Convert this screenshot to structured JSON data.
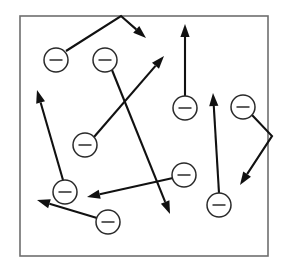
{
  "figure": {
    "domain_type": "diagram",
    "width": 290,
    "height": 272,
    "background_color": "#ffffff",
    "frame": {
      "name": "bounding-box",
      "x": 20,
      "y": 16,
      "width": 248,
      "height": 240,
      "stroke_color": "#6e6e6e",
      "fill_color": "#ffffff",
      "stroke_width": 1.6
    },
    "styles": {
      "vector_color": "#111111",
      "vector_width": 2.1,
      "charge_stroke_color": "#2a2a2a",
      "charge_fill_color": "#ffffff",
      "charge_radius": 12,
      "charge_sign_label": "minus",
      "charge_sign_half_width": 6.5,
      "arrow_head_length": 13,
      "arrow_head_half_width": 4.6
    },
    "charges": [
      {
        "id": "charge-1",
        "label": "minus",
        "cx": 56,
        "cy": 60,
        "r": 12
      },
      {
        "id": "charge-2",
        "label": "minus",
        "cx": 105,
        "cy": 60,
        "r": 12
      },
      {
        "id": "charge-3",
        "label": "minus",
        "cx": 185,
        "cy": 108,
        "r": 12
      },
      {
        "id": "charge-4",
        "label": "minus",
        "cx": 243,
        "cy": 107,
        "r": 12
      },
      {
        "id": "charge-5",
        "label": "minus",
        "cx": 85,
        "cy": 145,
        "r": 12
      },
      {
        "id": "charge-6",
        "label": "minus",
        "cx": 184,
        "cy": 175,
        "r": 12
      },
      {
        "id": "charge-7",
        "label": "minus",
        "cx": 219,
        "cy": 205,
        "r": 12
      },
      {
        "id": "charge-8",
        "label": "minus",
        "cx": 65,
        "cy": 192,
        "r": 12
      },
      {
        "id": "charge-9",
        "label": "minus",
        "cx": 108,
        "cy": 222,
        "r": 12
      }
    ],
    "vectors": [
      {
        "id": "vector-1",
        "description": "bent arrow from charge-1 up to apex then down-right",
        "points": [
          [
            66,
            51
          ],
          [
            121,
            16
          ],
          [
            146,
            38
          ]
        ],
        "arrowhead_at": "end"
      },
      {
        "id": "vector-2",
        "description": "arrow from charge-2 down-right to lower middle",
        "points": [
          [
            112,
            70
          ],
          [
            170,
            214
          ]
        ],
        "arrowhead_at": "end"
      },
      {
        "id": "vector-3",
        "description": "arrow from charge-5 up-right across the field",
        "points": [
          [
            94,
            137
          ],
          [
            164,
            56
          ]
        ],
        "arrowhead_at": "end"
      },
      {
        "id": "vector-4",
        "description": "vertical arrow upward from charge-3",
        "points": [
          [
            185,
            96
          ],
          [
            185,
            24
          ]
        ],
        "arrowhead_at": "end"
      },
      {
        "id": "vector-5",
        "description": "bent arrow from charge-4 right-down then down-left",
        "points": [
          [
            252,
            115
          ],
          [
            272,
            136
          ],
          [
            240,
            185
          ]
        ],
        "arrowhead_at": "end"
      },
      {
        "id": "vector-6",
        "description": "long arrow upward from charge-7",
        "points": [
          [
            219,
            193
          ],
          [
            213,
            93
          ]
        ],
        "arrowhead_at": "end"
      },
      {
        "id": "vector-7",
        "description": "arrow from charge-6 left-down to middle-left",
        "points": [
          [
            173,
            178
          ],
          [
            87,
            197
          ]
        ],
        "arrowhead_at": "end"
      },
      {
        "id": "vector-8",
        "description": "arrow from charge-8 up-left toward upper-left corner",
        "points": [
          [
            63,
            180
          ],
          [
            37,
            90
          ]
        ],
        "arrowhead_at": "end"
      },
      {
        "id": "vector-9",
        "description": "arrow from charge-9 up-left to the left edge",
        "points": [
          [
            97,
            218
          ],
          [
            37,
            200
          ]
        ],
        "arrowhead_at": "end"
      }
    ]
  }
}
